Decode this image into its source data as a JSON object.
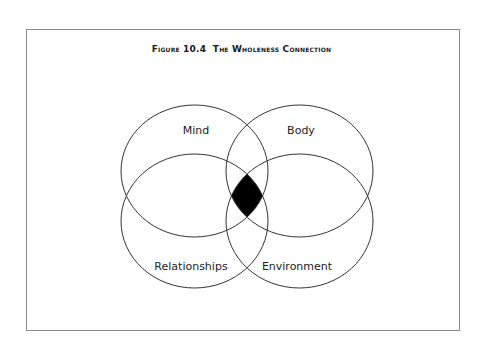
{
  "figure": {
    "title_label": "Figure 10.4",
    "title_text": "The Wholeness Connection"
  },
  "diagram": {
    "type": "venn",
    "sets": [
      {
        "name": "Mind",
        "position": "top-left"
      },
      {
        "name": "Body",
        "position": "top-right"
      },
      {
        "name": "Relationships",
        "position": "bottom-left"
      },
      {
        "name": "Environment",
        "position": "bottom-right"
      }
    ],
    "highlight": {
      "region": "intersection of all four",
      "fill": "#000000"
    },
    "stroke_color": "#333333"
  }
}
